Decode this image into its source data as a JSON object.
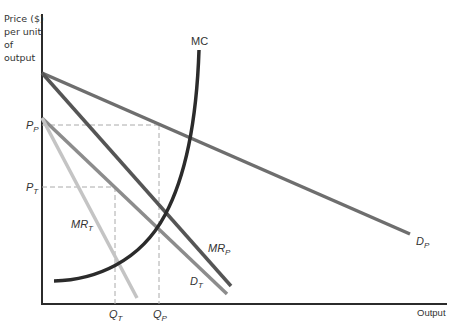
{
  "diagram": {
    "top_cut_text": "",
    "y_axis_label": [
      "Price ($)",
      "per unit",
      "of output"
    ],
    "x_axis_label": "Output",
    "curves": {
      "mc": {
        "label": "MC",
        "color": "#2b2b2b"
      },
      "demand_p": {
        "label_main": "D",
        "label_sub": "P",
        "color": "#6e6e6e"
      },
      "mr_p": {
        "label_main": "MR",
        "label_sub": "P",
        "color": "#555555"
      },
      "demand_t": {
        "label_main": "D",
        "label_sub": "T",
        "color": "#8c8c8c"
      },
      "mr_t": {
        "label_main": "MR",
        "label_sub": "T",
        "color": "#bdbdbd"
      }
    },
    "price_ticks": [
      {
        "main": "P",
        "sub": "P"
      },
      {
        "main": "P",
        "sub": "T"
      }
    ],
    "quantity_ticks": [
      {
        "main": "Q",
        "sub": "T"
      },
      {
        "main": "Q",
        "sub": "P"
      }
    ]
  }
}
